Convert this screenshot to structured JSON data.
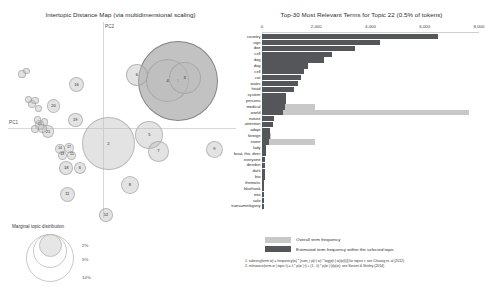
{
  "left": {
    "title": "Intertopic Distance Map (via multidimensional scaling)",
    "axis": {
      "x_label": "PC1",
      "y_label": "PC2"
    },
    "marginal": {
      "title": "Marginal topic distribution",
      "sizes": [
        "2%",
        "5%",
        "10%"
      ]
    },
    "topics": [
      {
        "id": "1",
        "x": 0.745,
        "y": 0.3,
        "r": 0.175,
        "selected": true
      },
      {
        "id": "4",
        "x": 0.7,
        "y": 0.3,
        "r": 0.095,
        "selected": false
      },
      {
        "id": "3",
        "x": 0.775,
        "y": 0.285,
        "r": 0.07,
        "selected": false
      },
      {
        "id": "6",
        "x": 0.565,
        "y": 0.27,
        "r": 0.048,
        "selected": false
      },
      {
        "id": "2",
        "x": 0.44,
        "y": 0.62,
        "r": 0.115,
        "selected": false
      },
      {
        "id": "5",
        "x": 0.62,
        "y": 0.575,
        "r": 0.062,
        "selected": false
      },
      {
        "id": "7",
        "x": 0.66,
        "y": 0.66,
        "r": 0.045,
        "selected": false
      },
      {
        "id": "9",
        "x": 0.905,
        "y": 0.65,
        "r": 0.038,
        "selected": false
      },
      {
        "id": "8",
        "x": 0.535,
        "y": 0.83,
        "r": 0.04,
        "selected": false
      },
      {
        "id": "16",
        "x": 0.3,
        "y": 0.32,
        "r": 0.033,
        "selected": false
      },
      {
        "id": "20",
        "x": 0.2,
        "y": 0.43,
        "r": 0.03,
        "selected": false
      },
      {
        "id": "19",
        "x": 0.295,
        "y": 0.5,
        "r": 0.032,
        "selected": false
      },
      {
        "id": "21",
        "x": 0.175,
        "y": 0.56,
        "r": 0.028,
        "selected": false
      },
      {
        "id": "18",
        "x": 0.255,
        "y": 0.745,
        "r": 0.03,
        "selected": false
      },
      {
        "id": "6b",
        "x": 0.315,
        "y": 0.745,
        "r": 0.027,
        "selected": false
      },
      {
        "id": "11",
        "x": 0.26,
        "y": 0.88,
        "r": 0.034,
        "selected": false
      },
      {
        "id": "12",
        "x": 0.43,
        "y": 0.985,
        "r": 0.03,
        "selected": false
      },
      {
        "id": "14",
        "x": 0.228,
        "y": 0.65,
        "r": 0.022,
        "selected": false
      },
      {
        "id": "17",
        "x": 0.268,
        "y": 0.645,
        "r": 0.022,
        "selected": false
      },
      {
        "id": "13",
        "x": 0.238,
        "y": 0.68,
        "r": 0.02,
        "selected": false
      },
      {
        "id": "15",
        "x": 0.28,
        "y": 0.68,
        "r": 0.02,
        "selected": false
      },
      {
        "id": "22",
        "x": 0.138,
        "y": 0.525,
        "r": 0.021,
        "selected": false
      },
      {
        "id": "23",
        "x": 0.152,
        "y": 0.545,
        "r": 0.019,
        "selected": false
      },
      {
        "id": "24",
        "x": 0.118,
        "y": 0.545,
        "r": 0.018,
        "selected": false
      },
      {
        "id": "25",
        "x": 0.16,
        "y": 0.51,
        "r": 0.017,
        "selected": false
      },
      {
        "id": "26",
        "x": 0.128,
        "y": 0.5,
        "r": 0.016,
        "selected": false
      },
      {
        "id": "27",
        "x": 0.105,
        "y": 0.42,
        "r": 0.018,
        "selected": false
      },
      {
        "id": "28",
        "x": 0.12,
        "y": 0.4,
        "r": 0.017,
        "selected": false
      },
      {
        "id": "29",
        "x": 0.09,
        "y": 0.395,
        "r": 0.016,
        "selected": false
      },
      {
        "id": "30",
        "x": 0.135,
        "y": 0.44,
        "r": 0.016,
        "selected": false
      },
      {
        "id": "31",
        "x": 0.062,
        "y": 0.265,
        "r": 0.017,
        "selected": false
      },
      {
        "id": "32",
        "x": 0.08,
        "y": 0.25,
        "r": 0.015,
        "selected": false
      }
    ]
  },
  "chart_data": {
    "type": "bar",
    "title": "Top-30 Most Relevant Terms for Topic 22 (0.5% of tokens)",
    "xlabel": "",
    "ylabel": "",
    "xlim": [
      0,
      8000
    ],
    "xticks": [
      0,
      2000,
      4000,
      6000,
      8000
    ],
    "xtick_labels": [
      "0",
      "2,000",
      "4,000",
      "6,000",
      "8,000"
    ],
    "grid": false,
    "legend_position": "bottom",
    "categories": [
      "country",
      "sign",
      "doe",
      "cell",
      "dog",
      "dog",
      "cell",
      "cat",
      "water",
      "head",
      "system",
      "persons",
      "medical",
      "world",
      "nature",
      "attention",
      "adopt",
      "foreign",
      "stone",
      "lady",
      "boat, the, deer",
      "everyone",
      "deerbin",
      "dark",
      "bio",
      "thematic",
      "bluehook",
      "into",
      "sale",
      "transamerkgony"
    ],
    "series": [
      {
        "name": "Overall term frequency",
        "values": [
          6500,
          4350,
          3420,
          2580,
          2300,
          1700,
          1560,
          1420,
          1310,
          1180,
          900,
          870,
          1950,
          7620,
          430,
          400,
          300,
          330,
          1950,
          150,
          130,
          120,
          110,
          100,
          95,
          90,
          85,
          80,
          75,
          70
        ]
      },
      {
        "name": "Estimated term frequency within the selected topic",
        "values": [
          6500,
          4350,
          3420,
          2580,
          2300,
          1700,
          1560,
          1420,
          1310,
          1180,
          900,
          870,
          830,
          780,
          430,
          400,
          300,
          300,
          270,
          150,
          130,
          120,
          110,
          100,
          95,
          90,
          85,
          80,
          75,
          70
        ]
      }
    ],
    "colors": {
      "overall": "#c8c8c8",
      "topic": "#55565a"
    }
  },
  "right": {
    "legend": [
      {
        "key": "overall",
        "label": "Overall term frequency"
      },
      {
        "key": "topic",
        "label": "Estimated term frequency within the selected topic"
      }
    ],
    "notes": [
      "1. saliency(term w) = frequency(w) * [sum_t p(t | w) * log(p(t | w)/p(t))] for topics t; see Chuang et. al (2012)",
      "2. relevance(term w | topic t) = λ * p(w | t) + (1 - λ) * p(w | t)/p(w); see Sievert & Shirley (2014)"
    ]
  }
}
